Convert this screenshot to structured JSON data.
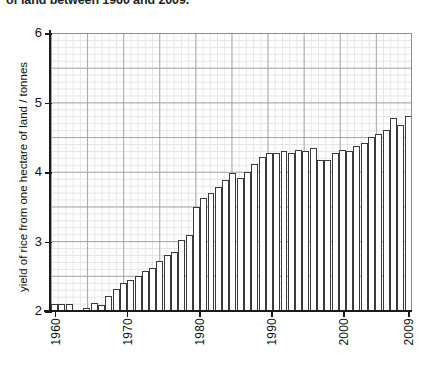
{
  "title": "of land between 1960 and 2009.",
  "axes": {
    "ylabel": "yield of rice from one hectare of land / tonnes",
    "yticks": [
      "2",
      "3",
      "4",
      "5",
      "6"
    ],
    "xticks": [
      "1960",
      "1970",
      "1980",
      "1990",
      "2000",
      "2009"
    ]
  },
  "chart_data": {
    "type": "bar",
    "title": "of land between 1960 and 2009.",
    "xlabel": "",
    "ylabel": "yield of rice from one hectare of land / tonnes",
    "ylim": [
      2,
      6
    ],
    "xlim": [
      1960,
      2009
    ],
    "grid": true,
    "legend": "none",
    "bar_style": "white fill, dark outline",
    "categories": [
      1960,
      1961,
      1962,
      1963,
      1964,
      1965,
      1966,
      1967,
      1968,
      1969,
      1970,
      1971,
      1972,
      1973,
      1974,
      1975,
      1976,
      1977,
      1978,
      1979,
      1980,
      1981,
      1982,
      1983,
      1984,
      1985,
      1986,
      1987,
      1988,
      1989,
      1990,
      1991,
      1992,
      1993,
      1994,
      1995,
      1996,
      1997,
      1998,
      1999,
      2000,
      2001,
      2002,
      2003,
      2004,
      2005,
      2006,
      2007,
      2008,
      2009
    ],
    "values": [
      2.1,
      2.1,
      2.1,
      2.0,
      2.0,
      2.05,
      2.12,
      2.08,
      2.22,
      2.32,
      2.4,
      2.45,
      2.5,
      2.58,
      2.62,
      2.72,
      2.8,
      2.85,
      3.02,
      3.1,
      3.5,
      3.62,
      3.7,
      3.78,
      3.88,
      3.98,
      3.92,
      4.0,
      4.12,
      4.22,
      4.28,
      4.28,
      4.3,
      4.28,
      4.32,
      4.3,
      4.35,
      4.18,
      4.18,
      4.28,
      4.32,
      4.3,
      4.38,
      4.42,
      4.5,
      4.55,
      4.6,
      4.78,
      4.68,
      4.8
    ],
    "tick_labels_shown": [
      "1960",
      "1970",
      "1980",
      "1990",
      "2000",
      "2009"
    ]
  }
}
